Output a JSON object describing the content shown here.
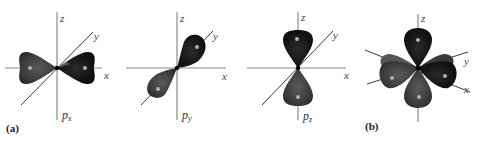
{
  "figure": {
    "panel_labels": {
      "a": "(a)",
      "b": "(b)"
    },
    "colors": {
      "lobe_light_phase": "#404040",
      "lobe_dark_phase": "#141414",
      "lobe_highlight": "#9a9a9a",
      "axis": "#8a8a8a"
    },
    "orbitals": [
      {
        "id": "px",
        "label_main": "p",
        "label_sub": "x",
        "axes": {
          "x": "x",
          "y": "y",
          "z": "z"
        }
      },
      {
        "id": "py",
        "label_main": "p",
        "label_sub": "y",
        "axes": {
          "x": "x",
          "y": "y",
          "z": "z"
        }
      },
      {
        "id": "pz",
        "label_main": "p",
        "label_sub": "z",
        "axes": {
          "x": "x",
          "y": "y",
          "z": "z"
        }
      },
      {
        "id": "combined",
        "axes": {
          "x": "x",
          "y": "y",
          "z": "z"
        }
      }
    ]
  }
}
